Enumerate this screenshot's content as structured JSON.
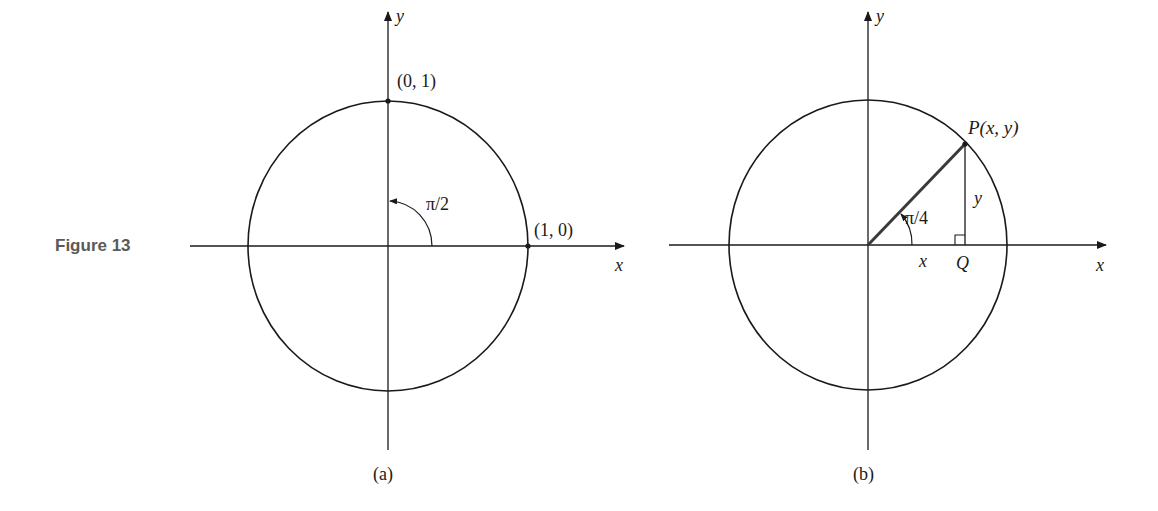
{
  "figure": {
    "label": "Figure 13",
    "colors": {
      "ink": "#1a1a1a",
      "caption": "#5a5a5a",
      "background": "#ffffff"
    }
  },
  "panel_a": {
    "caption": "(a)",
    "x_axis_label": "x",
    "y_axis_label": "y",
    "point_top_label": "(0, 1)",
    "point_right_label": "(1, 0)",
    "angle_label": "π/2"
  },
  "panel_b": {
    "caption": "(b)",
    "x_axis_label": "x",
    "y_axis_label": "y",
    "point_p_label": "P(x, y)",
    "segment_y_label": "y",
    "segment_x_label": "x",
    "point_q_label": "Q",
    "angle_label": "π/4"
  }
}
